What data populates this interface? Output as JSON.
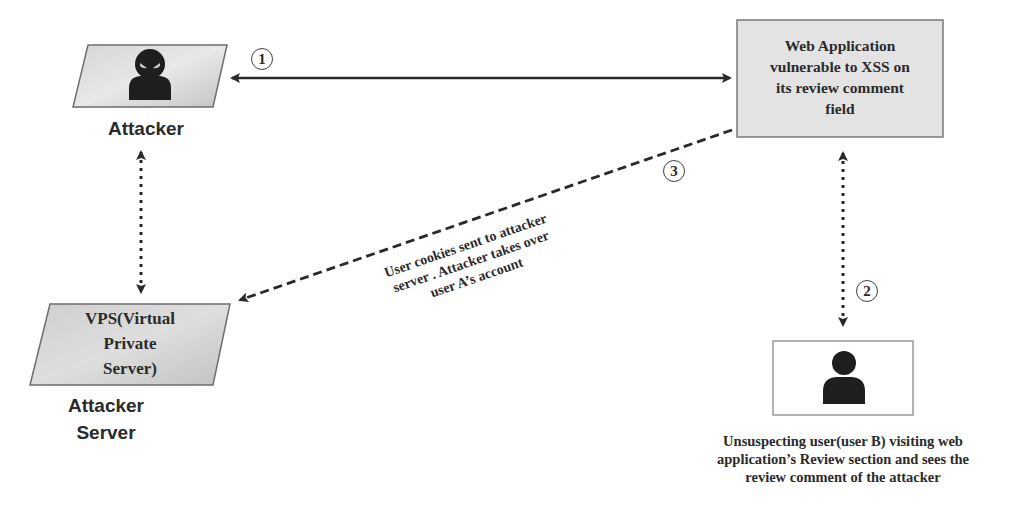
{
  "diagram": {
    "type": "xss-cookie-theft-flow",
    "nodes": {
      "attacker": {
        "label": "Attacker",
        "icon": "hacker-icon"
      },
      "vps": {
        "text_lines": [
          "VPS(Virtual",
          "Private",
          "Server)"
        ],
        "label_lines": [
          "Attacker",
          "Server"
        ]
      },
      "web_app": {
        "text_lines": [
          "Web Application",
          "vulnerable to XSS on",
          "its review comment",
          "field"
        ]
      },
      "victim": {
        "icon": "user-icon",
        "caption_lines": [
          "Unsuspecting user(user B) visiting web",
          "application’s Review section and sees the",
          "review comment of the attacker"
        ]
      }
    },
    "edges": [
      {
        "step": "1",
        "from": "attacker",
        "to": "web_app",
        "style": "solid",
        "direction": "both"
      },
      {
        "step": "2",
        "from": "web_app",
        "to": "victim",
        "style": "dotted",
        "direction": "both"
      },
      {
        "step": "3",
        "from": "web_app",
        "to": "vps",
        "style": "dashed",
        "direction": "forward",
        "label_lines": [
          "User cookies sent to attacker",
          "server . Attacker takes over",
          "user A’s account"
        ]
      },
      {
        "step": "",
        "from": "attacker",
        "to": "vps",
        "style": "dotted",
        "direction": "both"
      }
    ],
    "colors": {
      "box_fill": "#e3e3e3",
      "box_border": "#7a7a7a",
      "arrow": "#2a2a2a",
      "icon": "#1e1e1e"
    }
  }
}
